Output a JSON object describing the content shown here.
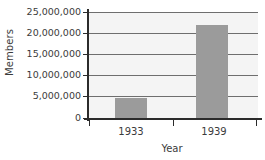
{
  "chart_data": {
    "type": "bar",
    "title": "",
    "xlabel": "Year",
    "ylabel": "Members",
    "categories": [
      "1933",
      "1939"
    ],
    "values": [
      4800000,
      22000000
    ],
    "series": [
      {
        "name": "Members",
        "values": [
          4800000,
          22000000
        ]
      }
    ],
    "ylim": [
      0,
      25000000
    ],
    "ytick_values": [
      0,
      5000000,
      10000000,
      15000000,
      20000000,
      25000000
    ],
    "ytick_labels": [
      "0",
      "5,000,000",
      "10,000,000",
      "15,000,000",
      "20,000,000",
      "25,000,000"
    ],
    "grid": true,
    "legend": "none",
    "bar_color": "#9b9b9b",
    "plot_background": "#f4f4f4",
    "axis_color": "#2b2b2b",
    "gridline_color": "#6e6e6e",
    "text_color": "#3b3b3b"
  }
}
